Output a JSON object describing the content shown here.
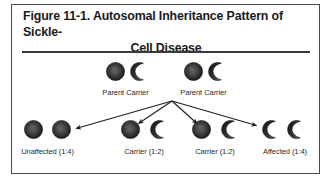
{
  "figure": {
    "title_line1": "Figure 11-1. Autosomal Inheritance Pattern of Sickle-",
    "title_line2": "Cell Disease",
    "title_full": "Figure 11-1. Autosomal Inheritance Pattern of Sickle-Cell Disease",
    "border_color": "#4a4a4a",
    "rule_color": "#3a3a3a",
    "background": "#ffffff",
    "text_color": "#1a1a1a"
  },
  "symbols": {
    "normal_allele": "filled-sphere-icon",
    "sickle_allele": "crescent-icon",
    "filled_color": "#2d2d2d",
    "crescent_color": "#262626"
  },
  "parents": [
    {
      "id": "parent-1",
      "label": "Parent Carrier",
      "alleles": [
        "normal",
        "sickle"
      ]
    },
    {
      "id": "parent-2",
      "label": "Parent Carrier",
      "alleles": [
        "normal",
        "sickle"
      ]
    }
  ],
  "offspring": [
    {
      "id": "offspring-unaffected",
      "label": "Unaffected (1:4)",
      "ratio": "1:4",
      "status": "Unaffected",
      "alleles": [
        "normal",
        "normal"
      ]
    },
    {
      "id": "offspring-carrier-1",
      "label": "Carrier (1:2)",
      "ratio": "1:2",
      "status": "Carrier",
      "alleles": [
        "normal",
        "sickle"
      ]
    },
    {
      "id": "offspring-carrier-2",
      "label": "Carrier (1:2)",
      "ratio": "1:2",
      "status": "Carrier",
      "alleles": [
        "normal",
        "sickle"
      ]
    },
    {
      "id": "offspring-affected",
      "label": "Affected (1:4)",
      "ratio": "1:4",
      "status": "Affected",
      "alleles": [
        "sickle",
        "sickle"
      ]
    }
  ],
  "arrows": {
    "origin_x": 172,
    "origin_y": 101,
    "color": "#1f1f1f",
    "count": 4,
    "targets": [
      {
        "to": "offspring-unaffected",
        "x": 74,
        "y": 129
      },
      {
        "to": "offspring-carrier-1",
        "x": 137,
        "y": 124
      },
      {
        "to": "offspring-carrier-2",
        "x": 196,
        "y": 124
      },
      {
        "to": "offspring-affected",
        "x": 258,
        "y": 126
      }
    ]
  }
}
